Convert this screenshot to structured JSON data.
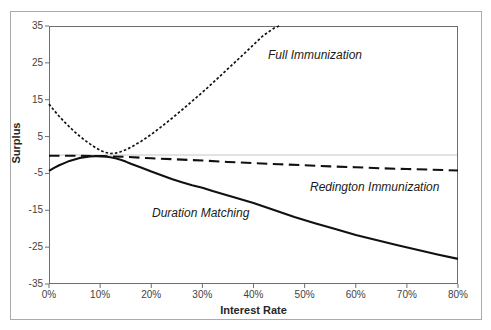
{
  "figure": {
    "background": "#ffffff",
    "border_color": "#ababab"
  },
  "chart_data": {
    "type": "line",
    "title": "",
    "xlabel": "Interest Rate",
    "ylabel": "Surplus",
    "xlim": [
      0,
      80
    ],
    "ylim": [
      -35,
      35
    ],
    "grid": "horizontal-zero-line-only",
    "legend_position": "inline-annotations",
    "x_ticks": {
      "values": [
        0,
        10,
        20,
        30,
        40,
        50,
        60,
        70,
        80
      ],
      "labels": [
        "0%",
        "10%",
        "20%",
        "30%",
        "40%",
        "50%",
        "60%",
        "70%",
        "80%"
      ]
    },
    "y_ticks": {
      "values": [
        35,
        25,
        15,
        5,
        -5,
        -15,
        -25,
        -35
      ],
      "labels": [
        "35",
        "25",
        "15",
        "5",
        "-5",
        "-15",
        "-25",
        "-35"
      ]
    },
    "colors": {
      "line": "#111111",
      "axis": "#6e6e6e",
      "zero_line": "#c6c6c6",
      "tick_text": "#3f3f3f"
    },
    "series": [
      {
        "name": "Full Immunization",
        "line_style": "dotted",
        "color": "#111111",
        "x": [
          0,
          1,
          2,
          3,
          4,
          5,
          6,
          7,
          8,
          9,
          10,
          11,
          12,
          13,
          14,
          15,
          16,
          18,
          20,
          22,
          24,
          26,
          28,
          30,
          32,
          34,
          36,
          38,
          40,
          42,
          44,
          45
        ],
        "y": [
          13.8,
          12.1,
          10.5,
          9.0,
          7.6,
          6.3,
          5.1,
          4.0,
          3.0,
          2.1,
          1.3,
          0.7,
          0.4,
          0.5,
          0.9,
          1.4,
          2.1,
          3.7,
          5.6,
          7.7,
          9.9,
          12.2,
          14.6,
          17.0,
          19.5,
          22.1,
          24.7,
          27.3,
          29.9,
          32.5,
          34.4,
          35.0
        ]
      },
      {
        "name": "Redington Immunization",
        "line_style": "dashed",
        "color": "#111111",
        "x": [
          0,
          5,
          10,
          15,
          20,
          25,
          30,
          35,
          40,
          45,
          50,
          55,
          60,
          65,
          70,
          75,
          80
        ],
        "y": [
          -0.2,
          -0.2,
          -0.3,
          -0.5,
          -0.9,
          -1.2,
          -1.5,
          -1.9,
          -2.2,
          -2.5,
          -2.8,
          -3.1,
          -3.3,
          -3.6,
          -3.8,
          -4.0,
          -4.2
        ]
      },
      {
        "name": "Duration Matching",
        "line_style": "solid",
        "color": "#111111",
        "x": [
          0,
          1,
          2,
          3,
          4,
          5,
          6,
          7,
          8,
          9,
          10,
          11,
          12,
          13,
          14,
          15,
          16,
          18,
          20,
          22,
          24,
          26,
          28,
          30,
          32,
          34,
          36,
          38,
          40,
          44,
          48,
          52,
          56,
          60,
          64,
          68,
          72,
          76,
          80
        ],
        "y": [
          -4.3,
          -3.5,
          -2.8,
          -2.2,
          -1.6,
          -1.2,
          -0.8,
          -0.6,
          -0.4,
          -0.3,
          -0.3,
          -0.4,
          -0.6,
          -0.9,
          -1.3,
          -1.8,
          -2.4,
          -3.4,
          -4.5,
          -5.5,
          -6.5,
          -7.4,
          -8.2,
          -8.9,
          -9.8,
          -10.6,
          -11.4,
          -12.2,
          -13.0,
          -14.9,
          -16.8,
          -18.5,
          -20.1,
          -21.7,
          -23.1,
          -24.4,
          -25.7,
          -27.0,
          -28.2
        ]
      }
    ]
  }
}
